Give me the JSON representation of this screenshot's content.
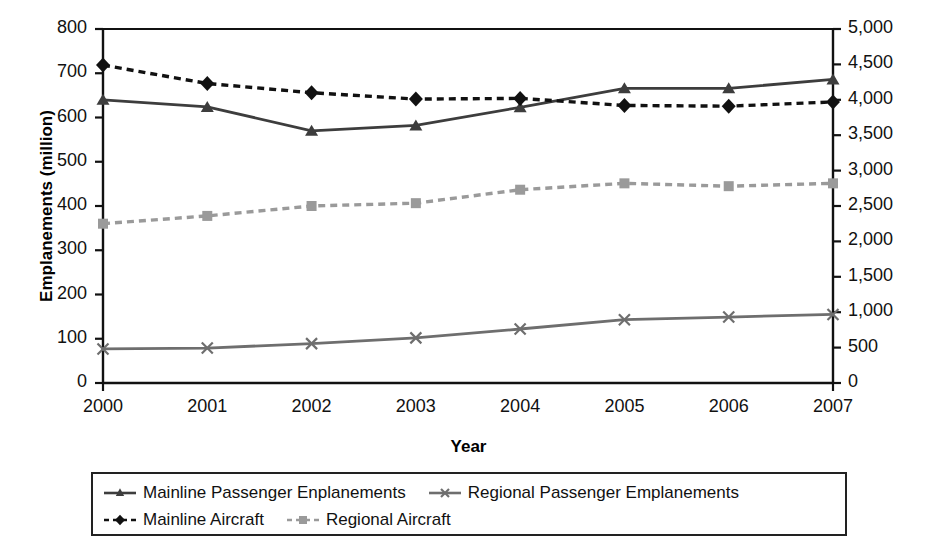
{
  "chart_data": {
    "type": "line",
    "title": "",
    "xlabel": "Year",
    "ylabel": "Emplanements (million)",
    "ylabel_right": "Aircraft",
    "categories": [
      "2000",
      "2001",
      "2002",
      "2003",
      "2004",
      "2005",
      "2006",
      "2007"
    ],
    "x": [
      2000,
      2001,
      2002,
      2003,
      2004,
      2005,
      2006,
      2007
    ],
    "ylim": [
      0,
      800
    ],
    "ylim_right": [
      0,
      5000
    ],
    "yticks": [
      "0",
      "100",
      "200",
      "300",
      "400",
      "500",
      "600",
      "700",
      "800"
    ],
    "ytick_values": [
      0,
      100,
      200,
      300,
      400,
      500,
      600,
      700,
      800
    ],
    "yticks_right": [
      "0",
      "500",
      "1,000",
      "1,500",
      "2,000",
      "2,500",
      "3,000",
      "3,500",
      "4,000",
      "4,500",
      "5,000"
    ],
    "ytick_values_right": [
      0,
      500,
      1000,
      1500,
      2000,
      2500,
      3000,
      3500,
      4000,
      4500,
      5000
    ],
    "grid": false,
    "legend_position": "bottom",
    "series": [
      {
        "name": "Mainline Passenger Enplanements",
        "axis": "left",
        "marker": "triangle",
        "linestyle": "solid",
        "color": "#3d3d3d",
        "values": [
          640,
          624,
          570,
          582,
          623,
          666,
          666,
          686
        ]
      },
      {
        "name": "Regional Passenger Emplanements",
        "axis": "left",
        "marker": "cross",
        "linestyle": "solid",
        "color": "#6e6e6e",
        "values": [
          77,
          79,
          89,
          102,
          122,
          143,
          149,
          155
        ]
      },
      {
        "name": "Mainline Aircraft",
        "axis": "right",
        "marker": "diamond",
        "linestyle": "dashed",
        "color": "#111111",
        "values": [
          4490,
          4230,
          4100,
          4010,
          4020,
          3920,
          3910,
          3970
        ]
      },
      {
        "name": "Regional Aircraft",
        "axis": "right",
        "marker": "square",
        "linestyle": "dashed",
        "color": "#9a9a9a",
        "values": [
          2250,
          2360,
          2500,
          2540,
          2730,
          2820,
          2780,
          2820
        ]
      }
    ]
  },
  "legend": {
    "items": [
      {
        "label": "Mainline Passenger Enplanements"
      },
      {
        "label": "Regional Passenger Emplanements"
      },
      {
        "label": "Mainline Aircraft"
      },
      {
        "label": "Regional Aircraft"
      }
    ]
  }
}
